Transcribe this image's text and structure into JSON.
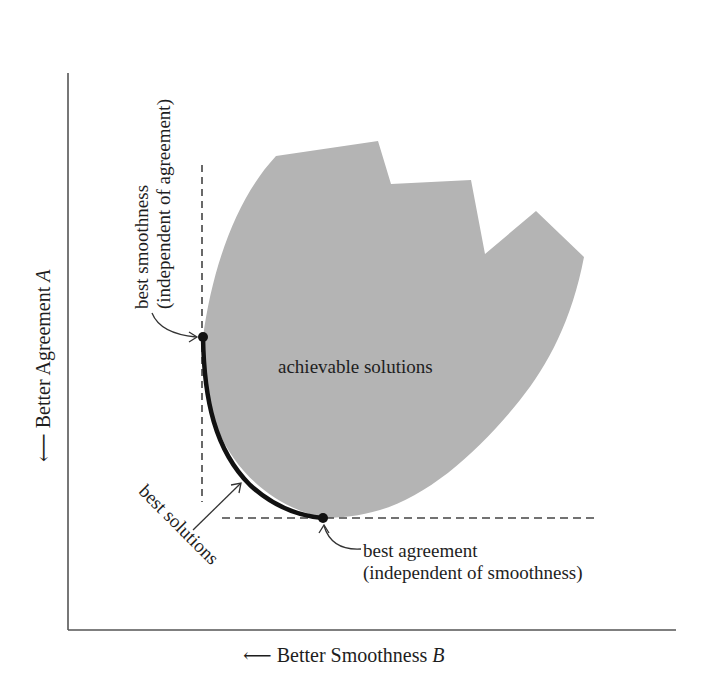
{
  "diagram": {
    "type": "pareto-front tradeoff diagram",
    "axes": {
      "x_label": "Better Smoothness",
      "x_symbol": "B",
      "x_arrow": "⟵",
      "y_label": "Better Agreement",
      "y_symbol": "A",
      "y_arrow": "⟵"
    },
    "region": {
      "label": "achievable solutions",
      "fill_color": "#b4b4b4"
    },
    "curve": {
      "label": "best solutions",
      "color": "#111111"
    },
    "annotations": {
      "best_smoothness_line1": "best smoothness",
      "best_smoothness_line2": "(independent of agreement)",
      "best_agreement_line1": "best agreement",
      "best_agreement_line2": "(independent of smoothness)"
    },
    "colors": {
      "axis": "#555555",
      "dashed": "#444444",
      "text": "#1e1e1e"
    }
  }
}
